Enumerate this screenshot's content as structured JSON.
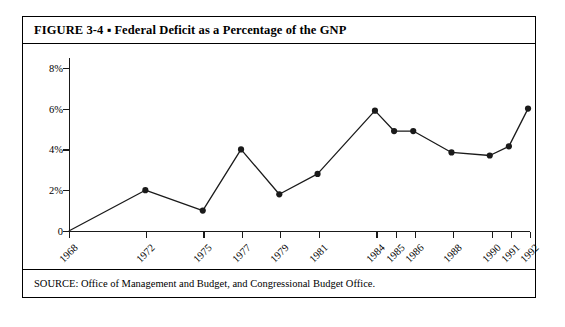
{
  "figure": {
    "title": "FIGURE 3-4 ▪ Federal Deficit as a Percentage of the GNP",
    "source": "SOURCE: Office of Management and Budget, and Congressional Budget Office."
  },
  "chart_data": {
    "type": "line",
    "title": "Federal Deficit as a Percentage of the GNP",
    "xlabel": "",
    "ylabel": "",
    "categories": [
      "1968",
      "1972",
      "1975",
      "1977",
      "1979",
      "1981",
      "1984",
      "1985",
      "1986",
      "1988",
      "1990",
      "1991",
      "1992"
    ],
    "x": [
      1968,
      1972,
      1975,
      1977,
      1979,
      1981,
      1984,
      1985,
      1986,
      1988,
      1990,
      1991,
      1992
    ],
    "values": [
      0.0,
      2.0,
      1.0,
      4.0,
      1.8,
      2.8,
      5.9,
      4.9,
      4.9,
      3.85,
      3.7,
      4.15,
      6.0
    ],
    "ylim": [
      0,
      9
    ],
    "xlim": [
      1968,
      1992
    ],
    "yticks": [
      0,
      2,
      4,
      6,
      8
    ],
    "ytick_labels": [
      "0",
      "2%",
      "4%",
      "6%",
      "8%"
    ],
    "grid": false,
    "legend": false,
    "marker": "filled-circle",
    "line_color": "#1a1a1a",
    "marker_color": "#1a1a1a"
  }
}
